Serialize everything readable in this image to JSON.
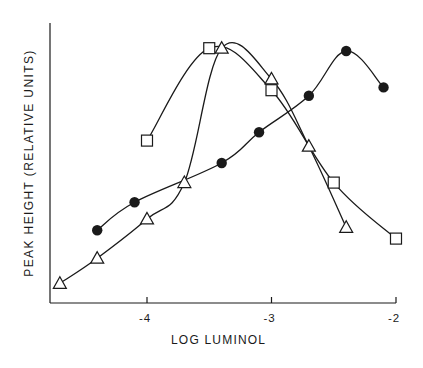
{
  "chart_data": {
    "type": "line",
    "title": "",
    "xlabel": "LOG LUMINOL",
    "ylabel": "PEAK HEIGHT (RELATIVE UNITS)",
    "xlim": [
      -4.8,
      -2.0
    ],
    "ylim": [
      0,
      100
    ],
    "x_ticks": [
      -4,
      -3,
      -2
    ],
    "x_tick_labels": [
      "-4",
      "-3",
      "-2"
    ],
    "y_ticks": [],
    "grid": false,
    "legend": null,
    "series": [
      {
        "name": "filled-circles",
        "marker": "circle-filled",
        "points": [
          {
            "x": -4.4,
            "y": 26
          },
          {
            "x": -4.1,
            "y": 36
          },
          {
            "x": -3.4,
            "y": 50
          },
          {
            "x": -3.1,
            "y": 61
          },
          {
            "x": -2.7,
            "y": 74
          },
          {
            "x": -2.4,
            "y": 90
          },
          {
            "x": -2.1,
            "y": 77
          }
        ]
      },
      {
        "name": "open-triangles",
        "marker": "triangle-open",
        "points": [
          {
            "x": -4.7,
            "y": 7
          },
          {
            "x": -4.4,
            "y": 16
          },
          {
            "x": -4.0,
            "y": 30
          },
          {
            "x": -3.7,
            "y": 43
          },
          {
            "x": -3.4,
            "y": 91
          },
          {
            "x": -3.0,
            "y": 80
          },
          {
            "x": -2.7,
            "y": 56
          },
          {
            "x": -2.4,
            "y": 27
          }
        ]
      },
      {
        "name": "open-squares",
        "marker": "square-open",
        "points": [
          {
            "x": -4.0,
            "y": 58
          },
          {
            "x": -3.5,
            "y": 91
          },
          {
            "x": -3.0,
            "y": 76
          },
          {
            "x": -2.5,
            "y": 43
          },
          {
            "x": -2.0,
            "y": 23
          }
        ]
      }
    ]
  },
  "axes": {
    "x_label": "LOG LUMINOL",
    "y_label": "PEAK HEIGHT (RELATIVE UNITS)",
    "x_tick_labels": [
      "-4",
      "-3",
      "-2"
    ]
  },
  "colors": {
    "ink": "#1a1a1a",
    "background": "#ffffff"
  }
}
